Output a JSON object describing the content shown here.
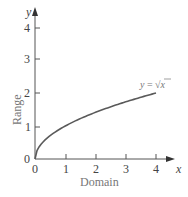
{
  "chart_data": {
    "type": "line",
    "title": "",
    "xlabel": "Domain",
    "ylabel": "Range",
    "x_var": "x",
    "y_var": "y",
    "xlim": [
      0,
      4
    ],
    "ylim": [
      0,
      4
    ],
    "x_ticks": [
      "0",
      "1",
      "2",
      "3",
      "4"
    ],
    "y_ticks": [
      "0",
      "1",
      "2",
      "3",
      "4"
    ],
    "grid": false,
    "legend": null,
    "series": [
      {
        "name": "y = √x",
        "x": [
          0,
          0.25,
          0.5,
          1,
          1.5,
          2,
          2.5,
          3,
          3.5,
          4
        ],
        "values": [
          0,
          0.5,
          0.707,
          1,
          1.225,
          1.414,
          1.581,
          1.732,
          1.871,
          2
        ]
      }
    ],
    "annotations": [
      {
        "text": "y = √x",
        "x": 4,
        "y": 2.2
      }
    ]
  },
  "labels": {
    "x_var": "x",
    "y_var": "y",
    "xlabel": "Domain",
    "ylabel": "Range",
    "curve_label_y": "y",
    "curve_label_eq": " = ",
    "curve_label_sqrt": "√",
    "curve_label_x": "x",
    "x_tick_0": "0",
    "x_tick_1": "1",
    "x_tick_2": "2",
    "x_tick_3": "3",
    "x_tick_4": "4",
    "y_tick_0": "0",
    "y_tick_1": "1",
    "y_tick_2": "2",
    "y_tick_3": "3",
    "y_tick_4": "4"
  },
  "colors": {
    "axis": "#555555",
    "curve": "#5a5a5a",
    "text": "#444444",
    "title_text": "#777777",
    "background": "#ffffff"
  }
}
